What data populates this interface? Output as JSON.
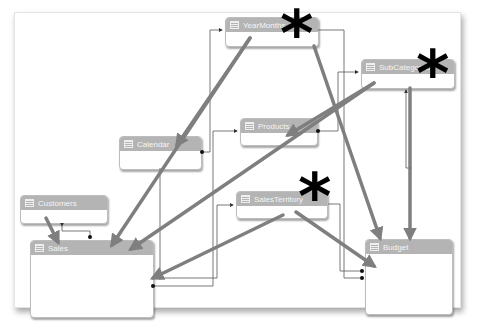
{
  "diagram": {
    "tables": [
      {
        "id": "yearmonths",
        "label": "YearMonths",
        "x": 225,
        "y": 17,
        "w": 92,
        "h": 28,
        "starred": true
      },
      {
        "id": "subcategories",
        "label": "SubCategories",
        "x": 361,
        "y": 59,
        "w": 92,
        "h": 28,
        "starred": true
      },
      {
        "id": "calendar",
        "label": "Calendar",
        "x": 119,
        "y": 136,
        "w": 81,
        "h": 32,
        "starred": false
      },
      {
        "id": "products",
        "label": "Products",
        "x": 240,
        "y": 118,
        "w": 76,
        "h": 26,
        "starred": false
      },
      {
        "id": "customers",
        "label": "Customers",
        "x": 20,
        "y": 195,
        "w": 86,
        "h": 27,
        "starred": false
      },
      {
        "id": "salesterritory",
        "label": "SalesTerritory",
        "x": 236,
        "y": 191,
        "w": 90,
        "h": 26,
        "starred": true
      },
      {
        "id": "sales",
        "label": "Sales",
        "x": 30,
        "y": 240,
        "w": 122,
        "h": 76,
        "starred": false
      },
      {
        "id": "budget",
        "label": "Budget",
        "x": 365,
        "y": 239,
        "w": 86,
        "h": 74,
        "starred": false
      }
    ],
    "stars": [
      {
        "for": "yearmonths",
        "x": 280,
        "y": 2
      },
      {
        "for": "subcategories",
        "x": 416,
        "y": 42
      },
      {
        "for": "salesterritory",
        "x": 298,
        "y": 165
      }
    ],
    "colors": {
      "header": "#b4b4b4",
      "header_text": "#f4f4f4",
      "arrow": "#7f7f7f",
      "connector": "#444444",
      "star": "#000000"
    }
  }
}
